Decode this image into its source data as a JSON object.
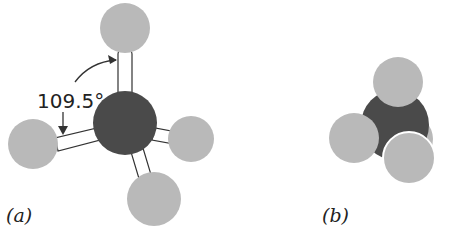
{
  "figure": {
    "panel_a": {
      "label": "(a)",
      "angle_label": "109.5°",
      "model": "ball-and-stick"
    },
    "panel_b": {
      "label": "(b)",
      "model": "space-filling"
    },
    "colors": {
      "carbon": "#4a4a4a",
      "hydrogen": "#b9b9b9",
      "bond": "#ffffff",
      "outline": "#333333"
    }
  }
}
